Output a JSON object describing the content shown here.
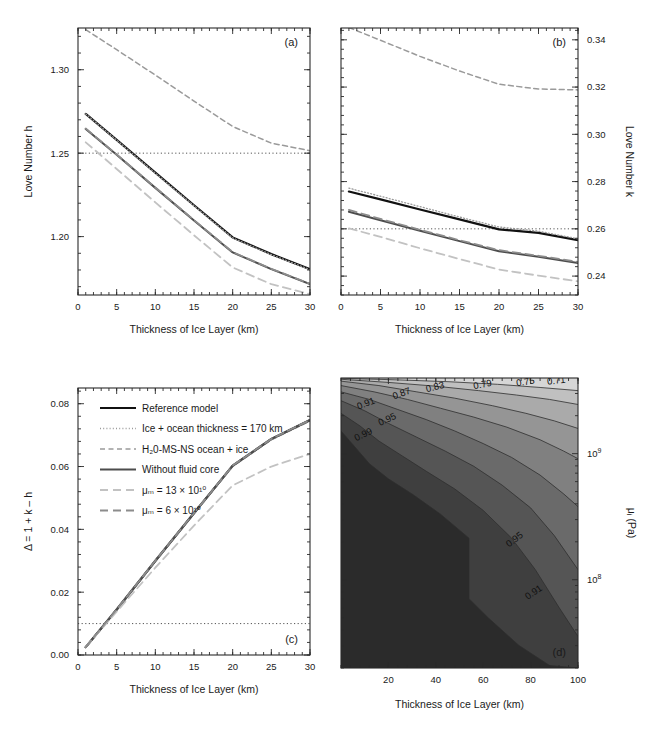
{
  "figure": {
    "panels": [
      "a",
      "b",
      "c",
      "d"
    ],
    "shared_xlabel": "Thickness of Ice Layer (km)"
  },
  "legend": {
    "entries": [
      {
        "label": "Reference model",
        "style": "solid",
        "color": "#111111",
        "width": 2.2
      },
      {
        "label": "Ice + ocean thickness = 170 km",
        "style": "dotted",
        "color": "#9a9a9a",
        "width": 1.3
      },
      {
        "label": "H₂0-MS-NS ocean + ice",
        "style": "dashed",
        "color": "#9a9a9a",
        "width": 1.5
      },
      {
        "label": "Without fluid core",
        "style": "solid",
        "color": "#4d4d4d",
        "width": 2.0
      },
      {
        "label": "μₘ = 13 × 10¹⁰",
        "style": "longdash",
        "color": "#c2c2c2",
        "width": 1.8
      },
      {
        "label": "μₘ = 6 × 10¹⁰",
        "style": "longdash",
        "color": "#8c8c8c",
        "width": 1.8
      }
    ]
  },
  "chart_data": [
    {
      "type": "line",
      "panel": "a",
      "tag": "(a)",
      "title": "",
      "xlabel": "Thickness of Ice Layer (km)",
      "ylabel": "Love Number h",
      "xlim": [
        0,
        30
      ],
      "ylim": [
        1.165,
        1.325
      ],
      "xticks": [
        0,
        5,
        10,
        15,
        20,
        25,
        30
      ],
      "xticklabels": [
        "0",
        "5",
        "10",
        "15",
        "20",
        "25",
        "30"
      ],
      "yticks": [
        1.2,
        1.25,
        1.3
      ],
      "yticklabels": [
        "1.20",
        "1.25",
        "1.30"
      ],
      "yaxis_side": "left",
      "grid": false,
      "reference_line": {
        "y": 1.25,
        "style": "dotted",
        "color": "#555555"
      },
      "x": [
        1,
        5,
        10,
        15,
        20,
        25,
        30
      ],
      "series": [
        {
          "name": "Reference model",
          "style": "solid",
          "color": "#111111",
          "width": 2.2,
          "values": [
            1.2735,
            1.258,
            1.2383,
            1.2188,
            1.1995,
            1.1895,
            1.1805
          ]
        },
        {
          "name": "Ice + ocean thickness = 170 km",
          "style": "dotted",
          "color": "#9a9a9a",
          "width": 1.3,
          "values": [
            1.2735,
            1.2578,
            1.238,
            1.2185,
            1.1992,
            1.1892,
            1.1802
          ]
        },
        {
          "name": "H₂0-MS-NS ocean + ice",
          "style": "dashed",
          "color": "#9a9a9a",
          "width": 1.5,
          "values": [
            1.324,
            1.312,
            1.2968,
            1.2812,
            1.266,
            1.256,
            1.2515
          ]
        },
        {
          "name": "Without fluid core",
          "style": "solid",
          "color": "#4d4d4d",
          "width": 2.0,
          "values": [
            1.2645,
            1.249,
            1.2292,
            1.2097,
            1.1905,
            1.1805,
            1.1715
          ]
        },
        {
          "name": "μₘ = 13 × 10¹⁰",
          "style": "longdash",
          "color": "#c2c2c2",
          "width": 1.8,
          "values": [
            1.2565,
            1.2405,
            1.2205,
            1.2008,
            1.1815,
            1.1715,
            1.1655
          ]
        },
        {
          "name": "μₘ = 6 × 10¹⁰",
          "style": "longdash",
          "color": "#8c8c8c",
          "width": 1.8,
          "values": [
            1.2648,
            1.2492,
            1.2294,
            1.2099,
            1.1907,
            1.1807,
            1.1717
          ]
        }
      ]
    },
    {
      "type": "line",
      "panel": "b",
      "tag": "(b)",
      "title": "",
      "xlabel": "Thickness of Ice Layer (km)",
      "ylabel": "Love Number k",
      "xlim": [
        0,
        30
      ],
      "ylim": [
        0.232,
        0.345
      ],
      "xticks": [
        0,
        5,
        10,
        15,
        20,
        25,
        30
      ],
      "xticklabels": [
        "0",
        "5",
        "10",
        "15",
        "20",
        "25",
        "30"
      ],
      "yticks": [
        0.24,
        0.26,
        0.28,
        0.3,
        0.32,
        0.34
      ],
      "yticklabels": [
        "0.24",
        "0.26",
        "0.28",
        "0.30",
        "0.32",
        "0.34"
      ],
      "yaxis_side": "right",
      "grid": false,
      "reference_line": {
        "y": 0.26,
        "style": "dotted",
        "color": "#555555"
      },
      "x": [
        1,
        5,
        10,
        15,
        20,
        25,
        30
      ],
      "series": [
        {
          "name": "Reference model",
          "style": "solid",
          "color": "#111111",
          "width": 2.2,
          "values": [
            0.2758,
            0.2725,
            0.2682,
            0.264,
            0.2598,
            0.2583,
            0.2552
          ]
        },
        {
          "name": "Ice + ocean thickness = 170 km",
          "style": "dotted",
          "color": "#9a9a9a",
          "width": 1.3,
          "values": [
            0.2772,
            0.2738,
            0.2694,
            0.265,
            0.2608,
            0.259,
            0.2558
          ]
        },
        {
          "name": "H₂0-MS-NS ocean + ice",
          "style": "dashed",
          "color": "#9a9a9a",
          "width": 1.5,
          "values": [
            0.3452,
            0.3398,
            0.333,
            0.3268,
            0.3212,
            0.3192,
            0.3188
          ]
        },
        {
          "name": "Without fluid core",
          "style": "solid",
          "color": "#4d4d4d",
          "width": 2.0,
          "values": [
            0.2672,
            0.2636,
            0.2592,
            0.2548,
            0.2505,
            0.2482,
            0.2455
          ]
        },
        {
          "name": "μₘ = 13 × 10¹⁰",
          "style": "longdash",
          "color": "#c2c2c2",
          "width": 1.8,
          "values": [
            0.2602,
            0.2566,
            0.2518,
            0.2472,
            0.2428,
            0.2402,
            0.2378
          ]
        },
        {
          "name": "μₘ = 6 × 10¹⁰",
          "style": "longdash",
          "color": "#8c8c8c",
          "width": 1.8,
          "values": [
            0.268,
            0.2642,
            0.2596,
            0.2552,
            0.251,
            0.2486,
            0.246
          ]
        }
      ]
    },
    {
      "type": "line",
      "panel": "c",
      "tag": "(c)",
      "title": "",
      "xlabel": "Thickness of Ice Layer (km)",
      "ylabel": "Δ = 1 + k – h",
      "xlim": [
        0,
        30
      ],
      "ylim": [
        0.0,
        0.085
      ],
      "xticks": [
        0,
        5,
        10,
        15,
        20,
        25,
        30
      ],
      "xticklabels": [
        "0",
        "5",
        "10",
        "15",
        "20",
        "25",
        "30"
      ],
      "yticks": [
        0.0,
        0.02,
        0.04,
        0.06,
        0.08
      ],
      "yticklabels": [
        "0.00",
        "0.02",
        "0.04",
        "0.06",
        "0.08"
      ],
      "yaxis_side": "left",
      "grid": false,
      "reference_line": {
        "y": 0.01,
        "style": "dotted",
        "color": "#555555"
      },
      "x": [
        1,
        5,
        10,
        15,
        20,
        25,
        30
      ],
      "series": [
        {
          "name": "Reference model",
          "style": "solid",
          "color": "#111111",
          "width": 2.2,
          "values": [
            0.0025,
            0.0145,
            0.03,
            0.0452,
            0.0603,
            0.0688,
            0.0748
          ]
        },
        {
          "name": "Ice + ocean thickness = 170 km",
          "style": "dotted",
          "color": "#9a9a9a",
          "width": 1.3,
          "values": [
            0.0026,
            0.0146,
            0.0302,
            0.0453,
            0.0604,
            0.0689,
            0.0749
          ]
        },
        {
          "name": "H₂0-MS-NS ocean + ice",
          "style": "dashed",
          "color": "#9a9a9a",
          "width": 1.5,
          "values": [
            0.0024,
            0.0143,
            0.0298,
            0.045,
            0.06,
            0.0685,
            0.0745
          ]
        },
        {
          "name": "Without fluid core",
          "style": "solid",
          "color": "#4d4d4d",
          "width": 2.0,
          "values": [
            0.0025,
            0.0144,
            0.0299,
            0.0451,
            0.0602,
            0.0687,
            0.0747
          ]
        },
        {
          "name": "μₘ = 13 × 10¹⁰",
          "style": "longdash",
          "color": "#c2c2c2",
          "width": 1.8,
          "values": [
            0.0026,
            0.0138,
            0.0278,
            0.0412,
            0.054,
            0.06,
            0.064
          ]
        },
        {
          "name": "μₘ = 6 × 10¹⁰",
          "style": "longdash",
          "color": "#8c8c8c",
          "width": 1.8,
          "values": [
            0.0025,
            0.0145,
            0.03,
            0.0452,
            0.0603,
            0.0688,
            0.0748
          ]
        }
      ]
    },
    {
      "type": "heatmap",
      "panel": "d",
      "tag": "(d)",
      "title": "",
      "xlabel": "Thickness of Ice Layer (km)",
      "ylabel": "μᵢ (Pa)",
      "xlim": [
        0,
        100
      ],
      "ylim_log": [
        7.3,
        9.6
      ],
      "xticks": [
        20,
        40,
        60,
        80,
        100
      ],
      "xticklabels": [
        "20",
        "40",
        "60",
        "80",
        "100"
      ],
      "yticks": [
        8,
        9
      ],
      "yticklabels": [
        "10⁸",
        "10⁹"
      ],
      "yaxis_side": "right",
      "yscale": "log",
      "grid": false,
      "contour_levels": [
        0.71,
        0.75,
        0.79,
        0.83,
        0.87,
        0.91,
        0.95,
        0.99
      ],
      "contour_labels": [
        "0.71",
        "0.75",
        "0.79",
        "0.83",
        "0.87",
        "0.91",
        "0.95",
        "0.99"
      ],
      "colormap": "grayscale",
      "band_colors": [
        "#2b2b2b",
        "#3f3f3f",
        "#555555",
        "#6a6a6a",
        "#808080",
        "#959595",
        "#aaaaaa",
        "#c0c0c0",
        "#d6d6d6",
        "#ececec",
        "#ffffff"
      ]
    }
  ]
}
